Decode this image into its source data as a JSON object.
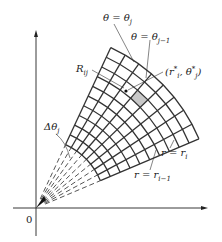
{
  "diagram": {
    "origin_label": "0",
    "labels": {
      "theta_j": "θ = θ",
      "theta_j_sub": "j",
      "theta_j_minus_1": "θ = θ",
      "theta_j_minus_1_sub": "j−1",
      "region": "R",
      "region_sub": "ij",
      "sample_point_open": "(r",
      "sample_point_r_sub": "i",
      "sample_point_sep": ", θ",
      "sample_point_theta_sub": "j",
      "sample_point_star": "*",
      "sample_point_close": ")",
      "delta_theta": "Δθ",
      "delta_theta_sub": "j",
      "r_i": "r = r",
      "r_i_sub": "i",
      "r_i_minus_1": "r = r",
      "r_i_minus_1_sub": "i−1"
    },
    "grid": {
      "origin": [
        36,
        208
      ],
      "inner_radius": 70,
      "outer_radius": 177,
      "rings": 10,
      "start_angle_deg": 23,
      "end_angle_deg": 65,
      "sectors": 8,
      "shaded_ring": 8,
      "shaded_sector": 5,
      "line_color": "#333333",
      "shade_color": "#c8c8c8"
    }
  }
}
